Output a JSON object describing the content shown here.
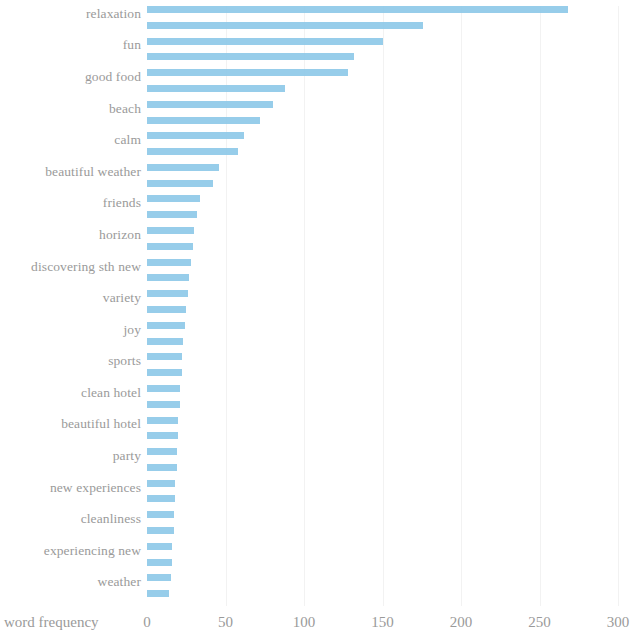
{
  "chart_data": {
    "type": "bar",
    "orientation": "horizontal",
    "title": "",
    "xlabel": "word frequency",
    "ylabel": "",
    "xlim": [
      0,
      300
    ],
    "xticks": [
      0,
      50,
      100,
      150,
      200,
      250,
      300
    ],
    "grid": true,
    "grid_axis": "x",
    "bar_color": "#8ec9e8",
    "categories": [
      "relaxation",
      "",
      "fun",
      "",
      "good food",
      "",
      "beach",
      "",
      "calm",
      "",
      "beautiful weather",
      "",
      "friends",
      "",
      "horizon",
      "",
      "discovering sth new",
      "",
      "variety",
      "",
      "joy",
      "",
      "sports",
      "",
      "clean hotel",
      "",
      "beautiful hotel",
      "",
      "party",
      "",
      "new experiences",
      "",
      "cleanliness",
      "",
      "experiencing new",
      "",
      "weather",
      ""
    ],
    "labeled_categories": [
      "relaxation",
      "fun",
      "good food",
      "beach",
      "calm",
      "beautiful weather",
      "friends",
      "horizon",
      "discovering sth new",
      "variety",
      "joy",
      "sports",
      "clean hotel",
      "beautiful hotel",
      "party",
      "new experiences",
      "cleanliness",
      "experiencing new",
      "weather"
    ],
    "values": [
      268,
      176,
      150,
      132,
      128,
      88,
      80,
      72,
      62,
      58,
      46,
      42,
      34,
      32,
      30,
      29,
      28,
      27,
      26,
      25,
      24,
      23,
      22,
      22,
      21,
      21,
      20,
      20,
      19,
      19,
      18,
      18,
      17,
      17,
      16,
      16,
      15,
      14
    ]
  },
  "axis": {
    "x_title": "word frequency",
    "tick_labels": [
      "0",
      "50",
      "100",
      "150",
      "200",
      "250",
      "300"
    ]
  }
}
